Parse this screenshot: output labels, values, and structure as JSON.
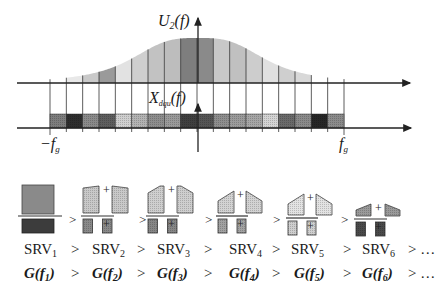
{
  "figure": {
    "top_plot": {
      "y_label_main": "U",
      "y_label_sub": "2",
      "y_label_arg": "(f)",
      "lower_label_main": "X",
      "lower_label_sub": "dqu",
      "lower_label_arg": "(f)",
      "x_left_label": "−f",
      "x_left_sub": "g",
      "x_right_label": "f",
      "x_right_sub": "g",
      "num_bins": 18,
      "bin_fills": [
        "#7d7d7d",
        "#2e2e2e",
        "#8a8a8a",
        "#5e5e5e",
        "#cfcfcf",
        "#b3b3b3",
        "#8d8d8d",
        "#9a9a9a",
        "#3f3f3f",
        "#555555",
        "#8e8e8e",
        "#9b9b9b",
        "#a6a6a6",
        "#d4d4d4",
        "#6a6a6a",
        "#8a8a8a",
        "#262626",
        "#8b8b8b"
      ],
      "curve_fills": [
        "#ffffff",
        "#e8e8e8",
        "#c9c9c9",
        "#9a9a9a",
        "#e2e2e2",
        "#cfcfcf",
        "#c2c2c2",
        "#bdbdbd",
        "#7e7e7e",
        "#8a8a8a",
        "#c8c8c8",
        "#c0c0c0",
        "#cdcdcd",
        "#e0e0e0",
        "#cfcfcf",
        "#d8d8d8",
        "#ffffff",
        "#ffffff"
      ]
    },
    "rows": {
      "srv": [
        {
          "main": "SRV",
          "sub": "1"
        },
        {
          "main": "SRV",
          "sub": "2"
        },
        {
          "main": "SRV",
          "sub": "3"
        },
        {
          "main": "SRV",
          "sub": "4"
        },
        {
          "main": "SRV",
          "sub": "5"
        },
        {
          "main": "SRV",
          "sub": "6"
        }
      ],
      "g": [
        {
          "main": "G(f",
          "sub": "1",
          "close": ")"
        },
        {
          "main": "G(f",
          "sub": "2",
          "close": ")"
        },
        {
          "main": "G(f",
          "sub": "3",
          "close": ")"
        },
        {
          "main": "G(f",
          "sub": "4",
          "close": ")"
        },
        {
          "main": "G(f",
          "sub": "5",
          "close": ")"
        },
        {
          "main": "G(f",
          "sub": "6",
          "close": ")"
        }
      ],
      "gt": ">",
      "tail": "> …"
    },
    "shape_symbols": {
      "plus": "+",
      "gt": ">"
    }
  }
}
